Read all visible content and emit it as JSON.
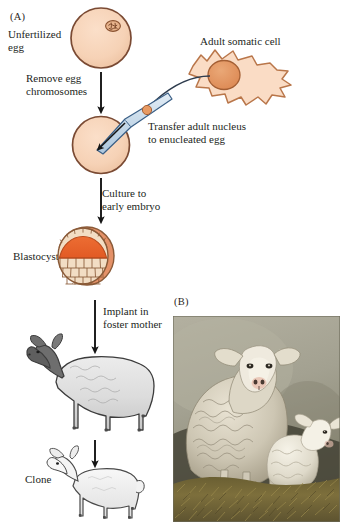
{
  "figure": {
    "title_a": "(A)",
    "title_b": "(B)",
    "panel_a_caption": "Somatic cell nuclear transfer cloning procedure diagram",
    "panel_b_caption": "Photograph of cloned sheep with lamb"
  },
  "panel_a": {
    "letter": "(A)",
    "labels": {
      "unfertilized_egg": "Unfertilized\negg",
      "remove_egg_chromosomes": "Remove egg\nchromosomes",
      "adult_somatic_cell": "Adult somatic cell",
      "transfer_nucleus": "Transfer adult nucleus\nto enucleated egg",
      "culture_to_early_embryo": "Culture to\nearly embryo",
      "blastocyst": "Blastocyst",
      "implant_in_foster_mother": "Implant in\nfoster mother",
      "clone": "Clone"
    },
    "steps": [
      {
        "id": "step-unfertilized-egg",
        "label": "Unfertilized egg"
      },
      {
        "id": "step-remove-chromosomes",
        "label": "Remove egg chromosomes"
      },
      {
        "id": "step-transfer-nucleus",
        "label": "Transfer adult nucleus to enucleated egg"
      },
      {
        "id": "step-culture-embryo",
        "label": "Culture to early embryo"
      },
      {
        "id": "step-blastocyst",
        "label": "Blastocyst"
      },
      {
        "id": "step-implant",
        "label": "Implant in foster mother"
      },
      {
        "id": "step-clone",
        "label": "Clone"
      }
    ],
    "colors": {
      "egg_fill": "#f7d3b9",
      "egg_outline": "#7a4a33",
      "cell_fill": "#fadcc5",
      "cell_outline": "#b9764a",
      "nucleus_fill": "#e2935f",
      "nucleus_outline": "#a45f34",
      "pipette_fill": "#cfe0ee",
      "pipette_outline": "#3a5f86",
      "inner_cell_mass": "#e8622a",
      "trophoblast_fill": "#f2ddc4",
      "trophoblast_outline": "#8a5a38",
      "arrow": "#1a1a1a",
      "sheep_body": "#e3e3e3",
      "sheep_head": "#6e6e6e",
      "sheep_outline": "#3c3c3c",
      "lamb_body": "#f2f2f2",
      "lamb_outline": "#4a4a4a"
    }
  },
  "panel_b": {
    "letter": "(B)",
    "photo": {
      "alt": "Adult cloned sheep standing behind a small white lamb on straw, plain gray studio backdrop",
      "subjects": [
        "adult sheep",
        "lamb"
      ],
      "colors": {
        "backdrop_top": "#a9a694",
        "backdrop_bottom": "#8d8b79",
        "straw": "#6e6238",
        "straw_highlight": "#9d8b4c",
        "fleece_light": "#efeadc",
        "fleece_shadow": "#b9b2a0",
        "dark_ground": "#2a2a22"
      }
    }
  }
}
